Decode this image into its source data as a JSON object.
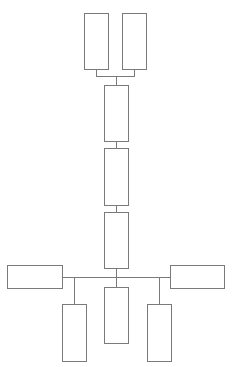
{
  "diagram": {
    "type": "block-tree",
    "background": "#ffffff",
    "stroke_color": "#7a7a7a",
    "nodes": [
      {
        "id": "top-left",
        "x": 84,
        "y": 13,
        "w": 25,
        "h": 57,
        "label": ""
      },
      {
        "id": "top-right",
        "x": 122,
        "y": 13,
        "w": 25,
        "h": 57,
        "label": ""
      },
      {
        "id": "spine-1",
        "x": 104,
        "y": 85,
        "w": 25,
        "h": 57,
        "label": ""
      },
      {
        "id": "spine-2",
        "x": 104,
        "y": 148,
        "w": 25,
        "h": 58,
        "label": ""
      },
      {
        "id": "spine-3",
        "x": 104,
        "y": 212,
        "w": 25,
        "h": 57,
        "label": ""
      },
      {
        "id": "left-wide",
        "x": 7,
        "y": 265,
        "w": 56,
        "h": 24,
        "label": ""
      },
      {
        "id": "right-wide",
        "x": 170,
        "y": 265,
        "w": 55,
        "h": 24,
        "label": ""
      },
      {
        "id": "bottom-left",
        "x": 62,
        "y": 304,
        "w": 25,
        "h": 58,
        "label": ""
      },
      {
        "id": "bottom-center",
        "x": 104,
        "y": 287,
        "w": 25,
        "h": 57,
        "label": ""
      },
      {
        "id": "bottom-right",
        "x": 147,
        "y": 304,
        "w": 25,
        "h": 58,
        "label": ""
      }
    ],
    "connectors": [
      {
        "id": "top-left-stem",
        "x": 96,
        "y": 70,
        "w": 1,
        "h": 7
      },
      {
        "id": "top-right-stem",
        "x": 134,
        "y": 70,
        "w": 1,
        "h": 7
      },
      {
        "id": "top-bar",
        "x": 96,
        "y": 76,
        "w": 39,
        "h": 1
      },
      {
        "id": "top-to-spine-1",
        "x": 116,
        "y": 76,
        "w": 1,
        "h": 9
      },
      {
        "id": "spine-1-to-2",
        "x": 116,
        "y": 142,
        "w": 1,
        "h": 6
      },
      {
        "id": "spine-2-to-3",
        "x": 116,
        "y": 206,
        "w": 1,
        "h": 6
      },
      {
        "id": "spine-3-to-bus",
        "x": 116,
        "y": 269,
        "w": 1,
        "h": 8
      },
      {
        "id": "bus",
        "x": 63,
        "y": 277,
        "w": 107,
        "h": 1
      },
      {
        "id": "bus-to-center",
        "x": 116,
        "y": 277,
        "w": 1,
        "h": 10
      },
      {
        "id": "bus-to-left",
        "x": 74,
        "y": 277,
        "w": 1,
        "h": 27
      },
      {
        "id": "bus-to-right",
        "x": 159,
        "y": 277,
        "w": 1,
        "h": 27
      }
    ]
  }
}
